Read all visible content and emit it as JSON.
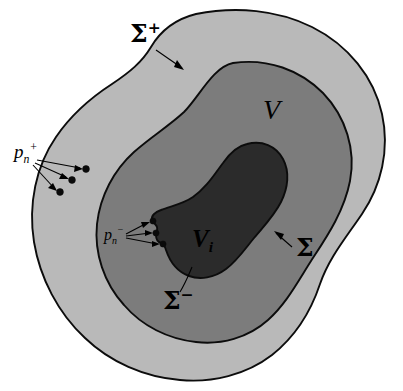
{
  "figure": {
    "background_color": "#ffffff",
    "width": 403,
    "height": 391
  },
  "colors": {
    "outer_shell_fill": "#b9b9b9",
    "mid_region_fill": "#7c7c7c",
    "inner_region_fill": "#2b2b2b",
    "boundary_stroke": "#0c0c0c",
    "label_color": "#000000",
    "page_background": "#ffffff"
  },
  "regions": [
    {
      "id": "outer-shell",
      "label": "",
      "fill": "#b9b9b9",
      "boundary_label": "sigma-plus",
      "description": "outer light gray shell bounded by Sigma plus"
    },
    {
      "id": "mid-region",
      "label": "V",
      "fill": "#7c7c7c",
      "boundary_label": "sigma",
      "description": "medium gray region V bounded by Sigma"
    },
    {
      "id": "inner-region",
      "label": "Vi",
      "fill": "#2b2b2b",
      "boundary_label": "sigma-minus",
      "description": "dark interior region V sub i bounded by Sigma minus"
    }
  ],
  "labels": {
    "sigma_plus": {
      "base": "Σ",
      "superscript": "+",
      "full": "Σ⁺",
      "x": 130,
      "y": 42
    },
    "sigma": {
      "base": "Σ",
      "superscript": "",
      "full": "Σ",
      "x": 296,
      "y": 252
    },
    "sigma_minus": {
      "base": "Σ",
      "superscript": "−",
      "full": "Σ⁻",
      "x": 163,
      "y": 305
    },
    "volume_v": {
      "base": "V",
      "subscript": "",
      "full": "V",
      "x": 263,
      "y": 119
    },
    "volume_vi": {
      "base": "V",
      "subscript": "i",
      "full": "Vᵢ",
      "x": 192,
      "y": 247
    },
    "p_n_plus": {
      "base": "p",
      "subscript": "n",
      "superscript": "+",
      "full": "pₙ⁺",
      "x": 14,
      "y": 158
    },
    "p_n_minus": {
      "base": "p",
      "subscript": "n",
      "superscript": "−",
      "full": "pₙ⁻",
      "x": 104,
      "y": 240
    }
  },
  "markers": {
    "p_n_plus_points": [
      {
        "x": 86,
        "y": 169
      },
      {
        "x": 72,
        "y": 180
      },
      {
        "x": 60,
        "y": 192
      }
    ],
    "p_n_minus_points": [
      {
        "x": 153,
        "y": 221
      },
      {
        "x": 156,
        "y": 233
      },
      {
        "x": 163,
        "y": 244
      }
    ]
  },
  "leaders": {
    "sigma_plus_arrow": {
      "from_x": 156,
      "from_y": 50,
      "to_x": 183,
      "to_y": 69
    },
    "sigma_arrow": {
      "from_x": 292,
      "from_y": 247,
      "to_x": 275,
      "to_y": 232
    },
    "sigma_minus_line": {
      "from_x": 178,
      "from_y": 294,
      "to_x": 192,
      "to_y": 266
    }
  }
}
